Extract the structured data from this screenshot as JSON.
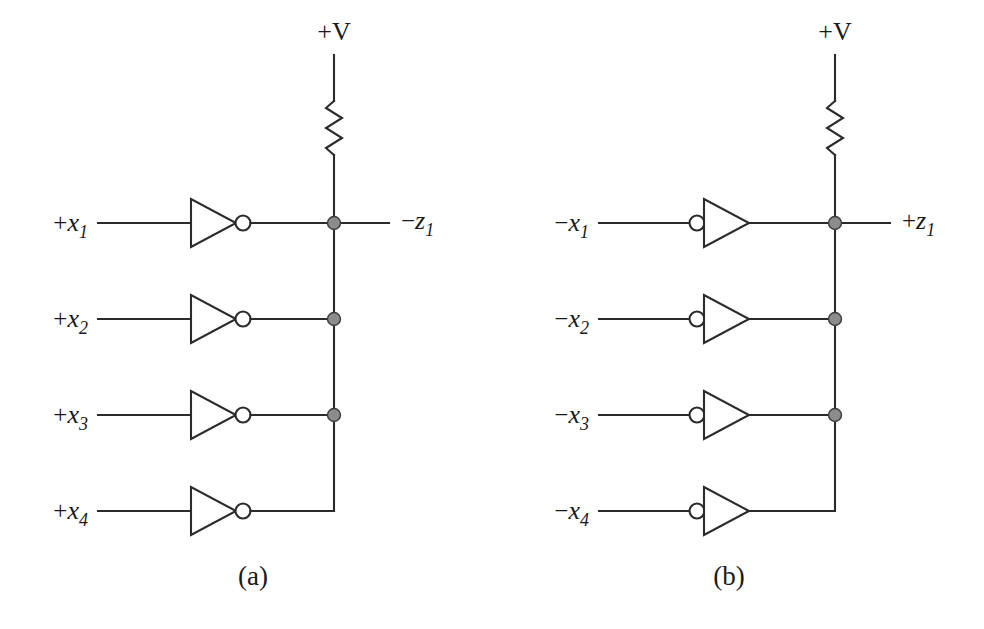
{
  "figure": {
    "name": "wired-logic-inverter-circuits",
    "background_color": "#ffffff",
    "line_color": "#2b2b2b",
    "junction_color": "#8c8c8c",
    "panels": [
      {
        "id": "a",
        "caption": "(a)",
        "supply_label": "+V",
        "resistor_name": "pull-up-resistor",
        "gate_type": "inverter",
        "bubble_side": "output",
        "output": {
          "sign": "−",
          "var": "z",
          "sub": "1"
        },
        "inputs": [
          {
            "sign": "+",
            "var": "x",
            "sub": "1"
          },
          {
            "sign": "+",
            "var": "x",
            "sub": "2"
          },
          {
            "sign": "+",
            "var": "x",
            "sub": "3"
          },
          {
            "sign": "+",
            "var": "x",
            "sub": "4"
          }
        ],
        "junction_rows": [
          1,
          2,
          3
        ],
        "corner_row": 4
      },
      {
        "id": "b",
        "caption": "(b)",
        "supply_label": "+V",
        "resistor_name": "pull-up-resistor",
        "gate_type": "inverter",
        "bubble_side": "input",
        "output": {
          "sign": "+",
          "var": "z",
          "sub": "1"
        },
        "inputs": [
          {
            "sign": "−",
            "var": "x",
            "sub": "1"
          },
          {
            "sign": "−",
            "var": "x",
            "sub": "2"
          },
          {
            "sign": "−",
            "var": "x",
            "sub": "3"
          },
          {
            "sign": "−",
            "var": "x",
            "sub": "4"
          }
        ],
        "junction_rows": [
          1,
          2,
          3
        ],
        "corner_row": 4
      }
    ]
  }
}
